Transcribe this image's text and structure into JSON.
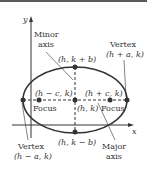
{
  "diagram": {
    "type": "ellipse-with-horizontal-major-axis",
    "axes": {
      "x_label": "x",
      "y_label": "y"
    },
    "labels": {
      "minor_axis_line1": "Minor",
      "minor_axis_line2": "axis",
      "vertex_right_title": "Vertex",
      "vertex_right_coord": "(h + a, k)",
      "covertex_top": "(h, k + b)",
      "focus_left_coord": "(h − c, k)",
      "focus_right_coord": "(h + c, k)",
      "focus_left_label": "Focus",
      "focus_right_label": "Focus",
      "center": "(h, k)",
      "covertex_bottom": "(h, k − b)",
      "vertex_left_title": "Vertex",
      "vertex_left_coord": "(h − a, k)",
      "major_axis_line1": "Major",
      "major_axis_line2": "axis"
    },
    "colors": {
      "stroke": "#333333",
      "top_border": "#5a5a5a"
    }
  }
}
